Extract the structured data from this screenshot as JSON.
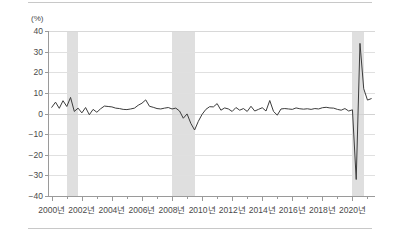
{
  "chart_data": {
    "type": "line",
    "title": "",
    "subtitle": "",
    "unit_label": "(%)",
    "xlabel": "",
    "ylabel": "",
    "ylim": [
      -40,
      40
    ],
    "xlim": [
      1999.75,
      2021.5
    ],
    "grid": true,
    "legend": "none",
    "ytick_labels": [
      "40",
      "30",
      "20",
      "10",
      "0",
      "-10",
      "-20",
      "-30",
      "-40"
    ],
    "ytick_values": [
      40,
      30,
      20,
      10,
      0,
      -10,
      -20,
      -30,
      -40
    ],
    "xtick_labels": [
      "2000년",
      "2002년",
      "2004년",
      "2006년",
      "2008년",
      "2010년",
      "2012년",
      "2014년",
      "2016년",
      "2018년",
      "2020년"
    ],
    "xtick_values": [
      2000,
      2002,
      2004,
      2006,
      2008,
      2010,
      2012,
      2014,
      2016,
      2018,
      2020
    ],
    "xtick_minor_values": [
      2001,
      2003,
      2005,
      2007,
      2009,
      2011,
      2013,
      2015,
      2017,
      2019,
      2021
    ],
    "shaded_bands": [
      {
        "name": "recession-band-2001",
        "start": 2001.0,
        "end": 2001.75,
        "color": "#d9d9d9"
      },
      {
        "name": "recession-band-2008",
        "start": 2008.0,
        "end": 2009.5,
        "color": "#d9d9d9"
      },
      {
        "name": "recession-band-2020",
        "start": 2020.0,
        "end": 2020.75,
        "color": "#d9d9d9"
      }
    ],
    "series": [
      {
        "name": "growth-rate",
        "color": "#3c3c3c",
        "x": [
          2000.0,
          2000.25,
          2000.5,
          2000.75,
          2001.0,
          2001.25,
          2001.5,
          2001.75,
          2002.0,
          2002.25,
          2002.5,
          2002.75,
          2003.0,
          2003.25,
          2003.5,
          2003.75,
          2004.0,
          2004.25,
          2004.5,
          2004.75,
          2005.0,
          2005.25,
          2005.5,
          2005.75,
          2006.0,
          2006.25,
          2006.5,
          2006.75,
          2007.0,
          2007.25,
          2007.5,
          2007.75,
          2008.0,
          2008.25,
          2008.5,
          2008.75,
          2009.0,
          2009.25,
          2009.5,
          2009.75,
          2010.0,
          2010.25,
          2010.5,
          2010.75,
          2011.0,
          2011.25,
          2011.5,
          2011.75,
          2012.0,
          2012.25,
          2012.5,
          2012.75,
          2013.0,
          2013.25,
          2013.5,
          2013.75,
          2014.0,
          2014.25,
          2014.5,
          2014.75,
          2015.0,
          2015.25,
          2015.5,
          2015.75,
          2016.0,
          2016.25,
          2016.5,
          2016.75,
          2017.0,
          2017.25,
          2017.5,
          2017.75,
          2018.0,
          2018.25,
          2018.5,
          2018.75,
          2019.0,
          2019.25,
          2019.5,
          2019.75,
          2020.0,
          2020.25,
          2020.5,
          2020.75,
          2021.0,
          2021.25
        ],
        "values": [
          3.0,
          5.5,
          2.5,
          6.2,
          3.4,
          7.8,
          1.0,
          2.6,
          0.3,
          2.9,
          -0.6,
          2.0,
          0.6,
          2.3,
          3.6,
          3.4,
          3.2,
          2.6,
          2.4,
          2.0,
          1.9,
          2.2,
          2.6,
          4.0,
          5.0,
          6.6,
          3.5,
          3.0,
          2.4,
          2.2,
          2.6,
          2.9,
          2.2,
          2.6,
          1.2,
          -2.3,
          -0.2,
          -4.8,
          -8.0,
          -3.8,
          -0.4,
          2.0,
          3.3,
          3.2,
          4.8,
          1.6,
          2.7,
          2.2,
          1.0,
          2.9,
          1.6,
          2.4,
          1.0,
          3.5,
          1.2,
          2.0,
          2.8,
          1.2,
          6.3,
          1.0,
          -0.8,
          2.2,
          2.4,
          2.2,
          2.0,
          2.7,
          2.3,
          2.1,
          2.3,
          2.0,
          2.4,
          2.2,
          2.8,
          3.0,
          2.7,
          2.6,
          2.0,
          1.6,
          2.4,
          1.2,
          1.8,
          -32.0,
          34.0,
          12.0,
          6.5,
          7.2
        ]
      }
    ],
    "annotations": []
  }
}
